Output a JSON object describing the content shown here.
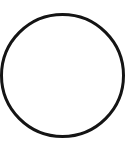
{
  "shape": {
    "type": "circle",
    "cx": 62.5,
    "cy": 75.5,
    "r": 61,
    "stroke": "#141414",
    "stroke_width": 3,
    "fill": "#ffffff"
  },
  "background": "#ffffff"
}
